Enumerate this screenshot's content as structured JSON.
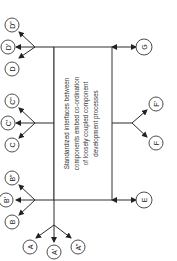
{
  "diagram": {
    "orientation": "rotated 90deg counter-clockwise",
    "center_box": {
      "lines": [
        "Standardized interfaces between",
        "components embed co-ordination",
        "of loosely coupled component",
        "development processes"
      ]
    },
    "nodes": {
      "A": "A",
      "A1": "A'",
      "A2": "A\"",
      "B": "B",
      "B1": "B'",
      "B2": "B\"",
      "C": "C",
      "C1": "C'",
      "C2": "C\"",
      "D": "D",
      "D1": "D'",
      "D2": "D\"",
      "E": "E",
      "F": "F",
      "F1": "F'",
      "G": "G"
    },
    "edges": [
      {
        "from": "box",
        "to": "A-group"
      },
      {
        "from": "box",
        "to": "B-group"
      },
      {
        "from": "box",
        "to": "C-group"
      },
      {
        "from": "box",
        "to": "D-group"
      },
      {
        "from": "box",
        "to": "E",
        "bidirectional": true
      },
      {
        "from": "box",
        "to": "F-group"
      },
      {
        "from": "box",
        "to": "G",
        "bidirectional": true
      }
    ]
  }
}
